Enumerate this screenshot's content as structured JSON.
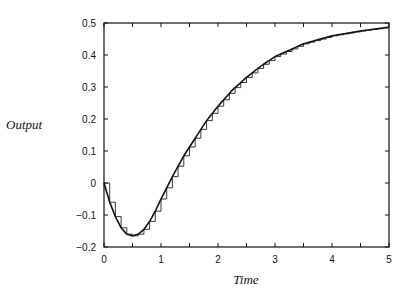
{
  "chart_data": {
    "type": "line",
    "title": "",
    "xlabel": "Time",
    "ylabel": "Output",
    "xlim": [
      0,
      5
    ],
    "ylim": [
      -0.2,
      0.5
    ],
    "grid": false,
    "legend": null,
    "x_ticks": [
      "0",
      "1",
      "2",
      "3",
      "4",
      "5"
    ],
    "y_ticks": [
      "-0.2",
      "-0.1",
      "0",
      "0.1",
      "0.2",
      "0.3",
      "0.4",
      "0.5"
    ],
    "series": [
      {
        "name": "continuous response",
        "style": "smooth line",
        "x": [
          0,
          0.1,
          0.2,
          0.3,
          0.4,
          0.5,
          0.6,
          0.7,
          0.8,
          0.9,
          1.0,
          1.2,
          1.4,
          1.6,
          1.8,
          2.0,
          2.25,
          2.5,
          2.75,
          3.0,
          3.5,
          4.0,
          4.5,
          5.0
        ],
        "y": [
          0,
          -0.06,
          -0.105,
          -0.14,
          -0.16,
          -0.165,
          -0.16,
          -0.145,
          -0.12,
          -0.088,
          -0.05,
          0.02,
          0.085,
          0.14,
          0.195,
          0.24,
          0.29,
          0.33,
          0.365,
          0.395,
          0.435,
          0.46,
          0.475,
          0.487
        ]
      },
      {
        "name": "sampled (zero-order hold) response",
        "style": "staircase, step width 0.1",
        "sample_period": 0.1
      }
    ]
  }
}
